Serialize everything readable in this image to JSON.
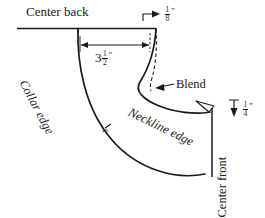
{
  "diagram": {
    "background_color": "#ffffff",
    "line_color": "#1a1a1a",
    "labels": {
      "center_back": "Center back",
      "collar_edge": "Collar edge",
      "neckline_edge": "Neckline edge",
      "blend": "Blend",
      "center_front": "Center front",
      "radius_mark": "r"
    },
    "dimensions": [
      {
        "name": "collar-width",
        "whole": "3",
        "numerator": "1",
        "denominator": "2",
        "unit": "″",
        "text": "3 1/2″",
        "arrow_style": "double-headed-horizontal"
      },
      {
        "name": "center-back-offset",
        "whole": "",
        "numerator": "1",
        "denominator": "8",
        "unit": "″",
        "text": "1/8″",
        "arrow_style": "single-headed-right"
      },
      {
        "name": "center-front-offset",
        "whole": "",
        "numerator": "1",
        "denominator": "4",
        "unit": "″",
        "text": "1/4″",
        "arrow_style": "single-headed-down"
      }
    ],
    "icons": {
      "blend_pointer": "arrow-icon",
      "dimension_arrow": "arrow-icon"
    }
  }
}
